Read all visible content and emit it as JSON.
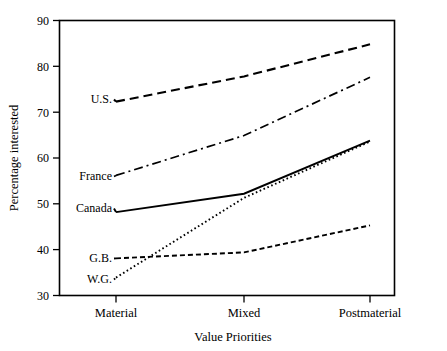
{
  "chart_data": {
    "type": "line",
    "title": "",
    "subtitle": "",
    "xlabel": "Value Priorities",
    "ylabel": "Percentage interested",
    "categories": [
      "Material",
      "Mixed",
      "Postmaterial"
    ],
    "xtick_labels": [
      "Material",
      "Mixed",
      "Postmaterial"
    ],
    "ytick_labels": [
      "30",
      "40",
      "50",
      "60",
      "70",
      "80",
      "90"
    ],
    "ytick_values": [
      30,
      40,
      50,
      60,
      70,
      80,
      90
    ],
    "ylim": [
      30,
      90
    ],
    "grid": false,
    "legend_position": "inline-left-labels",
    "annotations": [
      {
        "text": "U.S.",
        "series": "U.S.",
        "value": 72.3
      },
      {
        "text": "France",
        "series": "France",
        "value": 56.2
      },
      {
        "text": "Canada",
        "series": "Canada",
        "value": 48.2
      },
      {
        "text": "G.B.",
        "series": "G.B.",
        "value": 38.1
      },
      {
        "text": "W.G.",
        "series": "W.G.",
        "value": 33.9
      }
    ],
    "series": [
      {
        "name": "U.S.",
        "label": "U.S.",
        "style": "dashed",
        "dasharray": "9,5",
        "width": 2.1,
        "color": "#000000",
        "values": [
          72.3,
          77.8,
          84.8
        ]
      },
      {
        "name": "France",
        "label": "France",
        "style": "dash-dot",
        "dasharray": "9,4,2,4",
        "width": 1.7,
        "color": "#000000",
        "values": [
          56.2,
          64.9,
          77.6
        ]
      },
      {
        "name": "Canada",
        "label": "Canada",
        "style": "solid",
        "dasharray": "none",
        "width": 1.9,
        "color": "#000000",
        "values": [
          48.2,
          52.2,
          63.8
        ]
      },
      {
        "name": "G.B.",
        "label": "G.B.",
        "style": "short-dashed",
        "dasharray": "5,3",
        "width": 1.9,
        "color": "#000000",
        "values": [
          38.1,
          39.4,
          45.3
        ]
      },
      {
        "name": "W.G.",
        "label": "W.G.",
        "style": "dotted",
        "dasharray": "1.6,2.6",
        "width": 1.9,
        "color": "#000000",
        "values": [
          33.9,
          51.3,
          63.6
        ]
      }
    ]
  },
  "axes": {
    "y_title": "Percentage interested",
    "x_title": "Value Priorities",
    "y_ticks": [
      "90",
      "80",
      "70",
      "60",
      "50",
      "40",
      "30"
    ],
    "x_ticks": [
      "Material",
      "Mixed",
      "Postmaterial"
    ]
  },
  "labels": {
    "us": "U.S.",
    "france": "France",
    "canada": "Canada",
    "gb": "G.B.",
    "wg": "W.G."
  },
  "colors": {
    "ink": "#000000",
    "background": "#ffffff"
  }
}
